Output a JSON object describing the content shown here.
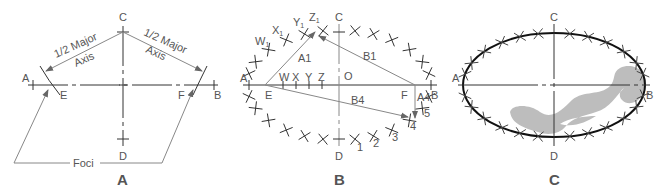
{
  "figure": {
    "panels": [
      {
        "id": "A",
        "caption": "A",
        "points": {
          "A": "A",
          "B": "B",
          "C": "C",
          "D": "D",
          "E": "E",
          "F": "F"
        },
        "annotations": {
          "left_half_major_line1": "1/2 Major",
          "left_half_major_line2": "Axis",
          "right_half_major_line1": "1/2 Major",
          "right_half_major_line2": "Axis",
          "foci": "Foci"
        }
      },
      {
        "id": "B",
        "caption": "B",
        "points": {
          "A": "A",
          "B": "B",
          "C": "C",
          "D": "D",
          "E": "E",
          "F": "F",
          "O": "O"
        },
        "axis_divisions": [
          "W",
          "X",
          "Y",
          "Z"
        ],
        "arc_points_upper": [
          "W",
          "X",
          "Y",
          "Z"
        ],
        "arc_subscript": "1",
        "arc_points_lower": [
          "1",
          "2",
          "3",
          "4",
          "5"
        ],
        "segments": {
          "A1": "A1",
          "B1": "B1",
          "B4": "B4",
          "A4": "A4"
        }
      },
      {
        "id": "C",
        "caption": "C",
        "points": {
          "A": "A",
          "B": "B",
          "C": "C",
          "D": "D"
        }
      }
    ],
    "colors": {
      "line": "#333333",
      "construction": "#888888",
      "label": "#555555",
      "french_curve": "#bdbdbd"
    }
  }
}
